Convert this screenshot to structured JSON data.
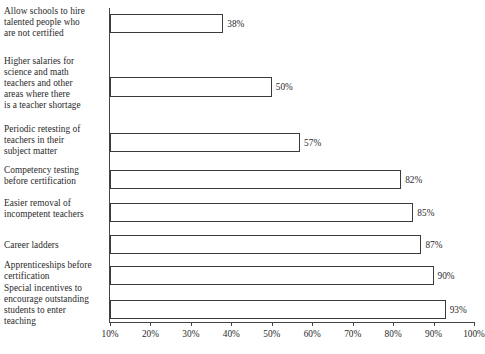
{
  "chart_data": {
    "type": "bar",
    "orientation": "horizontal",
    "title": "",
    "subtitle": "",
    "xlabel": "",
    "ylabel": "",
    "xlim": [
      10,
      100
    ],
    "grid": false,
    "legend": null,
    "categories": [
      "Allow schools to hire\ntalented people who\nare not certified",
      "Higher salaries for\nscience and math\nteachers and other\nareas where there\nis a teacher shortage",
      "Periodic retesting of\nteachers in their\nsubject matter",
      "Competency testing\nbefore certification",
      "Easier removal of\nincompetent teachers",
      "Career ladders",
      "Apprenticeships before\ncertification",
      "Special incentives to\nencourage outstanding\nstudents to enter\nteaching"
    ],
    "values": [
      38,
      50,
      57,
      82,
      85,
      87,
      90,
      93
    ],
    "value_labels": [
      "38%",
      "50%",
      "57%",
      "82%",
      "85%",
      "87%",
      "90%",
      "93%"
    ],
    "xticks": [
      10,
      20,
      30,
      40,
      50,
      60,
      70,
      80,
      90,
      100
    ],
    "xtick_labels": [
      "10%",
      "20%",
      "30%",
      "40%",
      "50%",
      "60%",
      "70%",
      "80%",
      "90%",
      "100%"
    ],
    "colors": {
      "bar_fill": "#ffffff",
      "bar_stroke": "#3a3a3a",
      "axis": "#444444",
      "text": "#2a2a2a",
      "background": "#ffffff"
    }
  },
  "layout": {
    "bar_rows": [
      {
        "top": 14,
        "height": 19,
        "label_top": 6
      },
      {
        "top": 77,
        "height": 20,
        "label_top": 56
      },
      {
        "top": 133,
        "height": 19,
        "label_top": 124
      },
      {
        "top": 170,
        "height": 19,
        "label_top": 165
      },
      {
        "top": 203,
        "height": 19,
        "label_top": 198
      },
      {
        "top": 235,
        "height": 19,
        "label_top": 236
      },
      {
        "top": 266,
        "height": 19,
        "label_top": 257
      },
      {
        "top": 300,
        "height": 19,
        "label_top": 282
      }
    ]
  }
}
